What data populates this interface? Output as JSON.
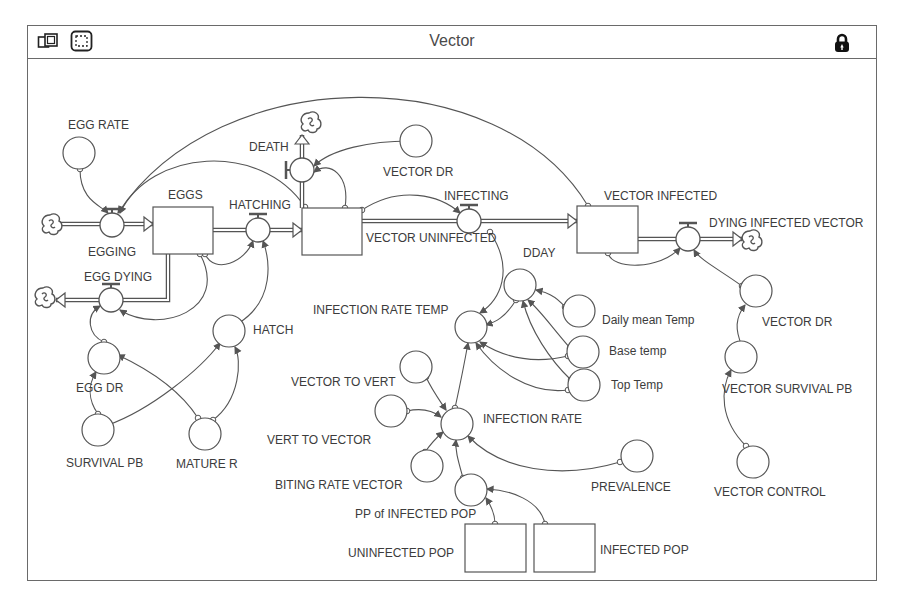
{
  "window": {
    "title": "Vector",
    "toolbar_icons": [
      "map-layer-icon",
      "selection-tool-icon"
    ],
    "lock_icon": "lock-icon"
  },
  "colors": {
    "line": "#555555",
    "frame": "#6a6a6a",
    "text": "#3c3c3c",
    "background": "#ffffff"
  },
  "stocks": [
    {
      "id": "eggs",
      "label": "EGGS",
      "x": 153,
      "y": 207,
      "w": 60,
      "h": 47,
      "lx": 168,
      "ly": 199
    },
    {
      "id": "vector-uninfected",
      "label": "VECTOR UNINFECTED",
      "x": 302,
      "y": 208,
      "w": 60,
      "h": 47,
      "lx": 366,
      "ly": 242
    },
    {
      "id": "vector-infected",
      "label": "VECTOR INFECTED",
      "x": 577,
      "y": 206,
      "w": 61,
      "h": 47,
      "lx": 604,
      "ly": 200
    },
    {
      "id": "uninfected-pop",
      "label": "UNINFECTED POP",
      "x": 465,
      "y": 524,
      "w": 61,
      "h": 48,
      "lx": 348,
      "ly": 557
    },
    {
      "id": "infected-pop",
      "label": "INFECTED POP",
      "x": 534,
      "y": 524,
      "w": 61,
      "h": 48,
      "lx": 600,
      "ly": 554
    }
  ],
  "flows": [
    {
      "id": "egging",
      "label": "EGGING",
      "cx": 112,
      "cy": 225,
      "lx": 88,
      "ly": 256,
      "valve": "top"
    },
    {
      "id": "hatching",
      "label": "HATCHING",
      "cx": 258,
      "cy": 230,
      "lx": 229,
      "ly": 209,
      "valve": "top"
    },
    {
      "id": "death",
      "label": "DEATH",
      "cx": 302,
      "cy": 170,
      "lx": 249,
      "ly": 151,
      "valve": "left"
    },
    {
      "id": "infecting",
      "label": "INFECTING",
      "cx": 469,
      "cy": 221,
      "lx": 444,
      "ly": 200,
      "valve": "top"
    },
    {
      "id": "dying-infected-vector",
      "label": "DYING INFECTED VECTOR",
      "cx": 688,
      "cy": 239,
      "lx": 709,
      "ly": 227,
      "valve": "top"
    },
    {
      "id": "egg-dying",
      "label": "EGG DYING",
      "cx": 111,
      "cy": 300,
      "lx": 84,
      "ly": 281,
      "valve": "top"
    }
  ],
  "converters": [
    {
      "id": "egg-rate",
      "label": "EGG RATE",
      "cx": 79,
      "cy": 153,
      "lx": 68,
      "ly": 129
    },
    {
      "id": "vector-dr-top",
      "label": "VECTOR DR",
      "cx": 416,
      "cy": 141,
      "lx": 383,
      "ly": 176
    },
    {
      "id": "egg-dr",
      "label": "EGG DR",
      "cx": 104,
      "cy": 358,
      "lx": 76,
      "ly": 392
    },
    {
      "id": "hatch",
      "label": "HATCH",
      "cx": 229,
      "cy": 331,
      "lx": 253,
      "ly": 334
    },
    {
      "id": "survival-pb",
      "label": "SURVIVAL PB",
      "cx": 98,
      "cy": 430,
      "lx": 66,
      "ly": 467
    },
    {
      "id": "mature-r",
      "label": "MATURE R",
      "cx": 205,
      "cy": 434,
      "lx": 176,
      "ly": 468
    },
    {
      "id": "dday",
      "label": "DDAY",
      "cx": 520,
      "cy": 285,
      "lx": 523,
      "ly": 257
    },
    {
      "id": "daily-mean-temp",
      "label": "Daily mean Temp",
      "cx": 579,
      "cy": 311,
      "lx": 602,
      "ly": 324
    },
    {
      "id": "base-temp",
      "label": "Base temp",
      "cx": 583,
      "cy": 352,
      "lx": 609,
      "ly": 355
    },
    {
      "id": "top-temp",
      "label": "Top Temp",
      "cx": 584,
      "cy": 385,
      "lx": 611,
      "ly": 389
    },
    {
      "id": "infection-rate-temp",
      "label": "INFECTION RATE TEMP",
      "cx": 471,
      "cy": 327,
      "lx": 313,
      "ly": 314
    },
    {
      "id": "vector-to-vert",
      "label": "VECTOR TO VERT",
      "cx": 416,
      "cy": 367,
      "lx": 291,
      "ly": 386
    },
    {
      "id": "vert-to-vector",
      "label": "VERT TO VECTOR",
      "cx": 391,
      "cy": 411,
      "lx": 267,
      "ly": 444
    },
    {
      "id": "infection-rate",
      "label": "INFECTION RATE",
      "cx": 457,
      "cy": 424,
      "lx": 483,
      "ly": 423
    },
    {
      "id": "biting-rate-vector",
      "label": "BITING RATE VECTOR",
      "cx": 427,
      "cy": 466,
      "lx": 275,
      "ly": 489
    },
    {
      "id": "prevalence",
      "label": "PREVALENCE",
      "cx": 637,
      "cy": 456,
      "lx": 591,
      "ly": 491
    },
    {
      "id": "pp-of-infected-pop",
      "label": "PP of INFECTED POP",
      "cx": 471,
      "cy": 490,
      "lx": 355,
      "ly": 518
    },
    {
      "id": "vector-dr-right",
      "label": "VECTOR DR",
      "cx": 756,
      "cy": 291,
      "lx": 762,
      "ly": 326
    },
    {
      "id": "vector-survival-pb",
      "label": "VECTOR SURVIVAL PB",
      "cx": 741,
      "cy": 357,
      "lx": 722,
      "ly": 393
    },
    {
      "id": "vector-control",
      "label": "VECTOR CONTROL",
      "cx": 753,
      "cy": 462,
      "lx": 714,
      "ly": 496
    }
  ],
  "clouds": [
    {
      "id": "egging-source",
      "cx": 52,
      "cy": 224
    },
    {
      "id": "egg-dying-sink",
      "cx": 45,
      "cy": 297
    },
    {
      "id": "death-sink",
      "cx": 311,
      "cy": 122
    },
    {
      "id": "dying-infected-sink",
      "cx": 752,
      "cy": 240
    }
  ],
  "pipes": [
    {
      "from": "egging-source",
      "pts": [
        [
          60,
          224
        ],
        [
          100,
          224
        ]
      ]
    },
    {
      "from": "egging",
      "pts": [
        [
          124,
          224
        ],
        [
          153,
          224
        ]
      ],
      "arrow": true
    },
    {
      "from": "eggs",
      "pts": [
        [
          213,
          230
        ],
        [
          246,
          230
        ]
      ]
    },
    {
      "from": "hatching",
      "pts": [
        [
          270,
          230
        ],
        [
          302,
          230
        ]
      ],
      "arrow": true
    },
    {
      "from": "eggs-down",
      "pts": [
        [
          168,
          254
        ],
        [
          168,
          300
        ],
        [
          123,
          300
        ]
      ]
    },
    {
      "from": "egg-dying",
      "pts": [
        [
          99,
          300
        ],
        [
          56,
          300
        ]
      ],
      "arrow": true
    },
    {
      "from": "vector-uninfected-up",
      "pts": [
        [
          302,
          208
        ],
        [
          302,
          182
        ]
      ]
    },
    {
      "from": "death",
      "pts": [
        [
          302,
          158
        ],
        [
          302,
          135
        ]
      ],
      "arrow": true
    },
    {
      "from": "vector-uninfected",
      "pts": [
        [
          362,
          221
        ],
        [
          457,
          221
        ]
      ]
    },
    {
      "from": "infecting",
      "pts": [
        [
          481,
          221
        ],
        [
          577,
          221
        ]
      ],
      "arrow": true
    },
    {
      "from": "vector-infected",
      "pts": [
        [
          638,
          239
        ],
        [
          676,
          239
        ]
      ]
    },
    {
      "from": "dying-infected-vector",
      "pts": [
        [
          700,
          239
        ],
        [
          742,
          239
        ]
      ],
      "arrow": true
    }
  ],
  "connectors": [
    {
      "d": "M80,169 C80,200 100,205 108,213"
    },
    {
      "d": "M588,206 C500,60 220,60 118,213"
    },
    {
      "d": "M305,207 C260,140 150,150 120,213"
    },
    {
      "d": "M205,254 C215,275 245,262 253,241"
    },
    {
      "d": "M200,254 C230,310 160,335 120,310"
    },
    {
      "d": "M239,323 C275,300 270,260 263,241"
    },
    {
      "d": "M416,141 C370,140 330,150 314,166"
    },
    {
      "d": "M345,208 C350,175 330,160 314,172"
    },
    {
      "d": "M362,210 C400,185 440,195 460,213"
    },
    {
      "d": "M608,253 C612,270 660,270 680,248"
    },
    {
      "d": "M742,286 C720,270 700,260 694,250"
    },
    {
      "d": "M104,342 C88,335 85,315 100,306"
    },
    {
      "d": "M98,414 C88,400 88,385 96,372"
    },
    {
      "d": "M108,425 C150,410 200,370 220,343"
    },
    {
      "d": "M198,418 C180,390 150,370 118,355"
    },
    {
      "d": "M213,420 C240,400 242,360 235,347"
    },
    {
      "d": "M490,232 C515,270 500,300 480,313"
    },
    {
      "d": "M516,300 C505,318 495,322 486,325"
    },
    {
      "d": "M565,307 C555,295 545,292 536,290"
    },
    {
      "d": "M570,348 C550,325 540,310 528,300"
    },
    {
      "d": "M571,380 C550,360 530,330 523,301"
    },
    {
      "d": "M568,356 C530,365 500,355 480,342"
    },
    {
      "d": "M568,390 C530,395 495,370 476,343"
    },
    {
      "d": "M455,408 C460,385 465,360 468,343"
    },
    {
      "d": "M426,377 C432,390 438,398 446,410"
    },
    {
      "d": "M407,411 C420,408 432,410 441,417"
    },
    {
      "d": "M425,452 C430,445 436,438 443,432"
    },
    {
      "d": "M463,478 C458,460 455,450 456,440"
    },
    {
      "d": "M620,462 C560,480 500,470 468,436"
    },
    {
      "d": "M495,524 C495,512 490,504 486,498"
    },
    {
      "d": "M545,524 C540,500 510,490 487,489"
    },
    {
      "d": "M742,346 C735,330 735,318 745,305"
    },
    {
      "d": "M746,446 C720,420 720,390 731,370"
    }
  ]
}
